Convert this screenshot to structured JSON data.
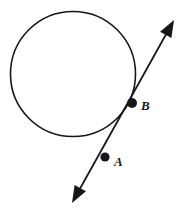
{
  "figure": {
    "background_color": "#ffffff",
    "stroke_color": "#17171a",
    "width": 184,
    "height": 214
  },
  "circle": {
    "name": "circle",
    "center_x": 73,
    "center_y": 74,
    "radius": 62.5,
    "stroke_width": 1.6,
    "fill": "none"
  },
  "line": {
    "name": "double-headed-arrow-line",
    "stroke_width": 1.9,
    "start_x": 72,
    "start_y": 203,
    "end_x": 174,
    "end_y": 20,
    "arrow_start": true,
    "arrow_end": true,
    "arrowhead_length": 17,
    "arrowhead_width": 13
  },
  "points": [
    {
      "id": "B",
      "label": "B",
      "x": 132,
      "y": 103,
      "radius": 5.0,
      "on_circle": true
    },
    {
      "id": "A",
      "label": "A",
      "x": 105,
      "y": 157,
      "radius": 4.6,
      "on_circle": false
    }
  ]
}
